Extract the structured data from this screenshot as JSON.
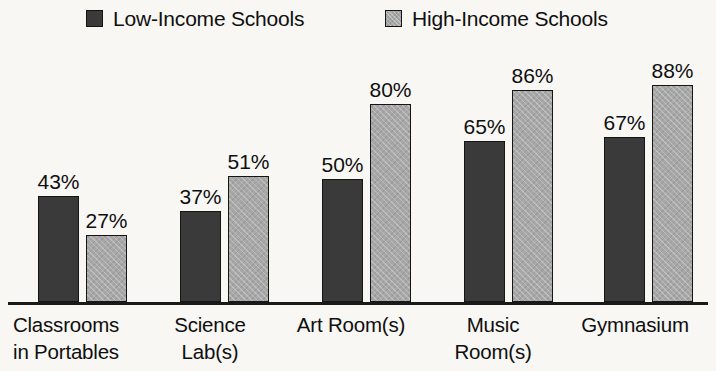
{
  "chart_data": {
    "type": "bar",
    "title": "",
    "subtitle": "",
    "xlabel": "",
    "ylabel": "",
    "ylim": [
      0,
      100
    ],
    "grid": false,
    "legend_position": "top",
    "value_suffix": "%",
    "categories": [
      "Classrooms in Portables",
      "Science Lab(s)",
      "Art Room(s)",
      "Music Room(s)",
      "Gymnasium"
    ],
    "category_lines": [
      [
        "Classrooms",
        "in Portables"
      ],
      [
        "Science",
        "Lab(s)"
      ],
      [
        "Art Room(s)",
        ""
      ],
      [
        "Music",
        "Room(s)"
      ],
      [
        "Gymnasium",
        ""
      ]
    ],
    "series": [
      {
        "name": "Low-Income Schools",
        "color": "#3a3a3a",
        "values": [
          43,
          37,
          50,
          65,
          67
        ],
        "labels": [
          "43%",
          "37%",
          "50%",
          "65%",
          "67%"
        ]
      },
      {
        "name": "High-Income Schools",
        "color": "#a8a8a8",
        "values": [
          27,
          51,
          80,
          86,
          88
        ],
        "labels": [
          "27%",
          "51%",
          "80%",
          "86%",
          "88%"
        ]
      }
    ]
  },
  "legend": {
    "items": [
      {
        "label": "Low-Income Schools",
        "swatch": "dark-gray-swatch"
      },
      {
        "label": "High-Income Schools",
        "swatch": "light-gray-hatched-swatch"
      }
    ]
  },
  "axis": {
    "baseline_color": "#1a1a1a"
  }
}
